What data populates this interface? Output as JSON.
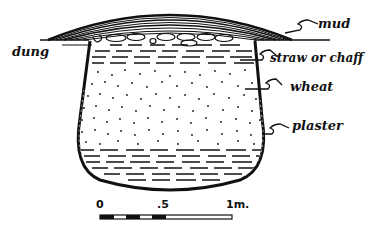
{
  "diagram": {
    "labels": {
      "mud": "mud",
      "dung": "dung",
      "straw": "straw or chaff",
      "wheat": "wheat",
      "plaster": "plaster"
    },
    "scale_bar": {
      "ticks": [
        "0",
        ".5",
        "1m."
      ]
    },
    "colors": {
      "ink": "#111111",
      "paper": "#ffffff"
    }
  }
}
